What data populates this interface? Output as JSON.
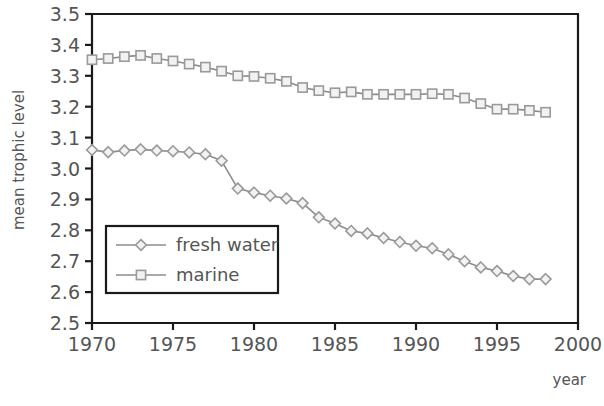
{
  "chart_data": {
    "type": "line",
    "title": "",
    "xlabel": "year",
    "ylabel": "mean trophic level",
    "xlim": [
      1970,
      2000
    ],
    "ylim": [
      2.5,
      3.5
    ],
    "xticks": [
      1970,
      1975,
      1980,
      1985,
      1990,
      1995,
      2000
    ],
    "yticks": [
      2.5,
      2.6,
      2.7,
      2.8,
      2.9,
      3.0,
      3.1,
      3.2,
      3.3,
      3.4,
      3.5
    ],
    "xtick_labels": [
      "1970",
      "1975",
      "1980",
      "1985",
      "1990",
      "1995",
      "2000"
    ],
    "ytick_labels": [
      "2.5",
      "2.6",
      "2.7",
      "2.8",
      "2.9",
      "3.0",
      "3.1",
      "3.2",
      "3.3",
      "3.4",
      "3.5"
    ],
    "grid": false,
    "legend_position": "lower-left-inside",
    "x": [
      1970,
      1971,
      1972,
      1973,
      1974,
      1975,
      1976,
      1977,
      1978,
      1979,
      1980,
      1981,
      1982,
      1983,
      1984,
      1985,
      1986,
      1987,
      1988,
      1989,
      1990,
      1991,
      1992,
      1993,
      1994,
      1995,
      1996,
      1997,
      1998
    ],
    "series": [
      {
        "name": "fresh water",
        "marker": "diamond",
        "color": "#9a9a9a",
        "values": [
          3.06,
          3.053,
          3.058,
          3.062,
          3.058,
          3.056,
          3.052,
          3.046,
          3.025,
          2.935,
          2.922,
          2.912,
          2.903,
          2.888,
          2.842,
          2.822,
          2.798,
          2.79,
          2.775,
          2.762,
          2.75,
          2.742,
          2.722,
          2.7,
          2.68,
          2.668,
          2.652,
          2.642,
          2.642
        ]
      },
      {
        "name": "marine",
        "marker": "square",
        "color": "#9a9a9a",
        "values": [
          3.352,
          3.356,
          3.362,
          3.366,
          3.356,
          3.348,
          3.338,
          3.328,
          3.315,
          3.3,
          3.298,
          3.292,
          3.282,
          3.262,
          3.252,
          3.245,
          3.248,
          3.24,
          3.24,
          3.24,
          3.24,
          3.242,
          3.24,
          3.228,
          3.21,
          3.192,
          3.192,
          3.188,
          3.182
        ]
      }
    ]
  },
  "legend": {
    "entries": [
      {
        "label": "fresh water"
      },
      {
        "label": "marine"
      }
    ]
  },
  "axes": {
    "x_axis_title": "year",
    "y_axis_title": "mean trophic level"
  }
}
